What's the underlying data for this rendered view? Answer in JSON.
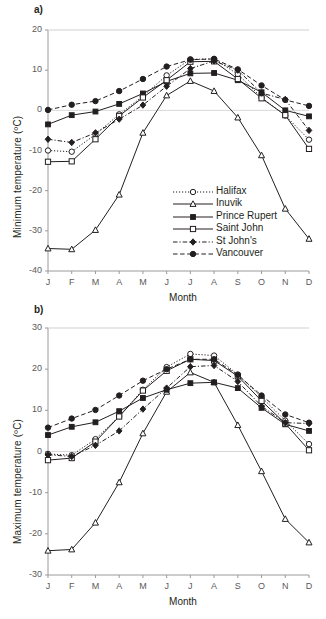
{
  "figure": {
    "panel_a_label": "a)",
    "panel_b_label": "b)"
  },
  "legend": {
    "position": "inside-lower-right-of-panel-a",
    "entries": [
      {
        "label": "Halifax",
        "line": "dotted",
        "marker": "open-circle"
      },
      {
        "label": "Inuvik",
        "line": "solid",
        "marker": "open-triangle"
      },
      {
        "label": "Prince Rupert",
        "line": "solid",
        "marker": "filled-square"
      },
      {
        "label": "Saint John",
        "line": "solid",
        "marker": "open-square"
      },
      {
        "label": "St John's",
        "line": "dash-dot",
        "marker": "filled-diamond"
      },
      {
        "label": "Vancouver",
        "line": "dashed",
        "marker": "filled-circle"
      }
    ]
  },
  "colors": {
    "ink": "#231f20",
    "axis": "#9a9a9a",
    "tick_text": "#5a5a5a",
    "background": "#ffffff"
  },
  "chart_data": [
    {
      "type": "line",
      "panel": "a",
      "title": "a)",
      "xlabel": "Month",
      "ylabel": "Minimum  temperature (ºC)",
      "categories": [
        "J",
        "F",
        "M",
        "A",
        "M",
        "J",
        "J",
        "A",
        "S",
        "O",
        "N",
        "D"
      ],
      "x": [
        "J",
        "F",
        "M",
        "A",
        "M",
        "J",
        "J",
        "A",
        "S",
        "O",
        "N",
        "D"
      ],
      "ylim": [
        -40,
        20
      ],
      "yticks": [
        -40,
        -30,
        -20,
        -10,
        0,
        10,
        20
      ],
      "grid": false,
      "legend_position": "lower right inside axes",
      "series": [
        {
          "name": "Halifax",
          "line": "dotted",
          "marker": "open-circle",
          "values": [
            -10.0,
            -10.3,
            -6.0,
            -1.0,
            3.5,
            8.7,
            12.7,
            12.8,
            9.0,
            3.2,
            -1.3,
            -7.3
          ]
        },
        {
          "name": "Inuvik",
          "line": "solid",
          "marker": "open-triangle",
          "values": [
            -34.4,
            -34.6,
            -29.8,
            -21.0,
            -5.6,
            3.7,
            7.3,
            4.8,
            -1.8,
            -11.2,
            -24.5,
            -32.0
          ]
        },
        {
          "name": "Prince Rupert",
          "line": "solid",
          "marker": "filled-square",
          "values": [
            -3.5,
            -1.2,
            -0.3,
            1.6,
            4.2,
            7.2,
            9.2,
            9.3,
            7.5,
            4.5,
            0.0,
            -1.5
          ]
        },
        {
          "name": "Saint John",
          "line": "solid",
          "marker": "open-square",
          "values": [
            -12.8,
            -12.7,
            -7.2,
            -1.4,
            3.2,
            7.5,
            12.1,
            12.2,
            7.8,
            3.0,
            -1.2,
            -9.6
          ]
        },
        {
          "name": "St John's",
          "line": "dash-dot",
          "marker": "filled-diamond",
          "values": [
            -7.2,
            -8.0,
            -5.6,
            -2.2,
            1.3,
            6.0,
            10.4,
            12.3,
            10.0,
            4.3,
            2.7,
            -5.0
          ]
        },
        {
          "name": "Vancouver",
          "line": "dashed",
          "marker": "filled-circle",
          "values": [
            0.1,
            1.4,
            2.3,
            4.8,
            7.8,
            10.9,
            12.6,
            12.8,
            10.2,
            6.2,
            2.6,
            1.1
          ]
        }
      ]
    },
    {
      "type": "line",
      "panel": "b",
      "title": "b)",
      "xlabel": "Month",
      "ylabel": "Maximum  temperature (ºC)",
      "categories": [
        "J",
        "F",
        "M",
        "A",
        "M",
        "J",
        "J",
        "A",
        "S",
        "O",
        "N",
        "D"
      ],
      "x": [
        "J",
        "F",
        "M",
        "A",
        "M",
        "J",
        "J",
        "A",
        "S",
        "O",
        "N",
        "D"
      ],
      "ylim": [
        -30,
        30
      ],
      "yticks": [
        -30,
        -20,
        -10,
        0,
        10,
        20,
        30
      ],
      "grid": false,
      "legend_position": "none",
      "series": [
        {
          "name": "Halifax",
          "line": "dotted",
          "marker": "open-circle",
          "values": [
            -0.6,
            -0.9,
            3.0,
            8.6,
            15.0,
            20.5,
            23.7,
            23.3,
            18.7,
            13.2,
            7.5,
            1.8
          ]
        },
        {
          "name": "Inuvik",
          "line": "solid",
          "marker": "open-triangle",
          "values": [
            -24.1,
            -23.8,
            -17.3,
            -7.5,
            4.4,
            14.5,
            19.2,
            16.8,
            6.4,
            -4.8,
            -16.4,
            -22.1
          ]
        },
        {
          "name": "Prince Rupert",
          "line": "solid",
          "marker": "filled-square",
          "values": [
            4.0,
            6.0,
            7.1,
            9.8,
            13.0,
            15.0,
            16.6,
            16.8,
            15.4,
            10.6,
            6.6,
            5.0
          ]
        },
        {
          "name": "Saint John",
          "line": "solid",
          "marker": "open-square",
          "values": [
            -2.1,
            -1.6,
            2.4,
            8.5,
            14.8,
            19.6,
            22.4,
            22.1,
            18.3,
            12.3,
            6.8,
            0.3
          ]
        },
        {
          "name": "St John's",
          "line": "dash-dot",
          "marker": "filled-diamond",
          "values": [
            -0.8,
            -1.2,
            1.5,
            5.0,
            10.3,
            15.4,
            20.6,
            20.9,
            17.0,
            11.0,
            7.0,
            6.8
          ]
        },
        {
          "name": "Vancouver",
          "line": "dashed",
          "marker": "filled-circle",
          "values": [
            5.8,
            8.0,
            10.1,
            13.6,
            17.2,
            20.0,
            22.4,
            22.4,
            18.6,
            13.6,
            9.0,
            7.0
          ]
        }
      ]
    }
  ]
}
